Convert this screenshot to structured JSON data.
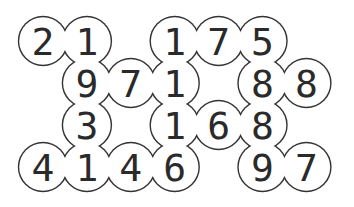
{
  "puzzle": {
    "rows": 4,
    "cols": 7,
    "cells": [
      {
        "row": 0,
        "col": 0,
        "value": "2"
      },
      {
        "row": 0,
        "col": 1,
        "value": "1"
      },
      {
        "row": 0,
        "col": 3,
        "value": "1"
      },
      {
        "row": 0,
        "col": 4,
        "value": "7"
      },
      {
        "row": 0,
        "col": 5,
        "value": "5"
      },
      {
        "row": 1,
        "col": 1,
        "value": "9"
      },
      {
        "row": 1,
        "col": 2,
        "value": "7"
      },
      {
        "row": 1,
        "col": 3,
        "value": "1"
      },
      {
        "row": 1,
        "col": 5,
        "value": "8"
      },
      {
        "row": 1,
        "col": 6,
        "value": "8"
      },
      {
        "row": 2,
        "col": 1,
        "value": "3"
      },
      {
        "row": 2,
        "col": 3,
        "value": "1"
      },
      {
        "row": 2,
        "col": 4,
        "value": "6"
      },
      {
        "row": 2,
        "col": 5,
        "value": "8"
      },
      {
        "row": 3,
        "col": 0,
        "value": "4"
      },
      {
        "row": 3,
        "col": 1,
        "value": "1"
      },
      {
        "row": 3,
        "col": 2,
        "value": "4"
      },
      {
        "row": 3,
        "col": 3,
        "value": "6"
      },
      {
        "row": 3,
        "col": 5,
        "value": "9"
      },
      {
        "row": 3,
        "col": 6,
        "value": "7"
      }
    ]
  },
  "colors": {
    "outline": "#333333",
    "digit": "#2a2a2a",
    "fill": "#ffffff"
  }
}
